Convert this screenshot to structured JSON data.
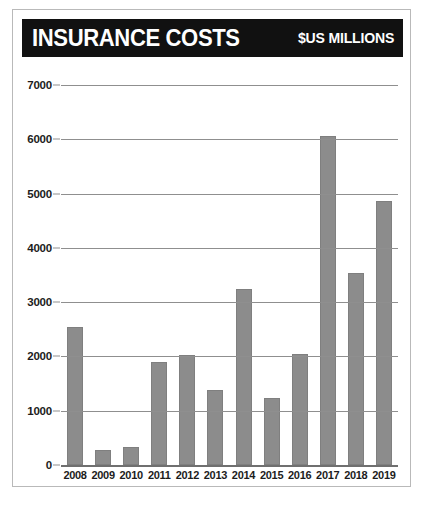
{
  "header": {
    "title": "INSURANCE COSTS",
    "units": "$US MILLIONS",
    "background_color": "#111111",
    "text_color": "#ffffff"
  },
  "chart_data": {
    "type": "bar",
    "title": "INSURANCE COSTS",
    "subtitle": "$US MILLIONS",
    "xlabel": "",
    "ylabel": "",
    "categories": [
      "2008",
      "2009",
      "2010",
      "2011",
      "2012",
      "2013",
      "2014",
      "2015",
      "2016",
      "2017",
      "2018",
      "2019"
    ],
    "values": [
      2550,
      280,
      330,
      1900,
      2030,
      1390,
      3250,
      1230,
      2050,
      6060,
      3530,
      4870
    ],
    "ylim": [
      0,
      7000
    ],
    "ytick_values": [
      0,
      1000,
      2000,
      3000,
      4000,
      5000,
      6000,
      7000
    ],
    "ytick_labels": [
      "0",
      "1000",
      "2000",
      "3000",
      "4000",
      "5000",
      "6000",
      "7000"
    ],
    "grid": true,
    "legend": false,
    "bar_color": "#8c8c8c",
    "gridline_color": "#8f8f8f",
    "axis_color": "#6f6f6f",
    "background_color": "#ffffff"
  }
}
